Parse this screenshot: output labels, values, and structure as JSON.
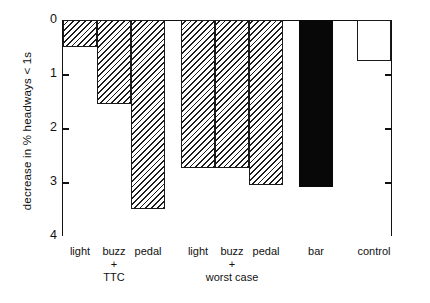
{
  "chart_data": {
    "type": "bar",
    "title": "",
    "xlabel": "",
    "ylabel": "decrease in % headways < 1s",
    "ylim": [
      0,
      4
    ],
    "y_inverted": true,
    "grid": false,
    "legend": null,
    "ytick_labels": [
      "0",
      "1",
      "2",
      "3",
      "4"
    ],
    "ytick_values": [
      0,
      1,
      2,
      3,
      4
    ],
    "categories": [
      "light",
      "buzz",
      "pedal",
      "light",
      "buzz",
      "pedal",
      "bar",
      "control"
    ],
    "values": [
      0.5,
      1.55,
      3.5,
      2.74,
      2.74,
      3.05,
      3.1,
      0.75
    ],
    "bar_styles": [
      "hatched",
      "hatched",
      "hatched",
      "hatched",
      "hatched",
      "hatched",
      "solid",
      "open"
    ],
    "groups": [
      {
        "label_line1": "+",
        "label_line2": "TTC",
        "members": [
          "light",
          "buzz",
          "pedal"
        ]
      },
      {
        "label_line1": "+",
        "label_line2": "worst case",
        "members": [
          "light",
          "buzz",
          "pedal"
        ]
      }
    ],
    "annotations": []
  },
  "axis": {
    "y_title": "decrease in % headways < 1s",
    "ticks": [
      {
        "label": "0",
        "value": 0
      },
      {
        "label": "1",
        "value": 1
      },
      {
        "label": "2",
        "value": 2
      },
      {
        "label": "3",
        "value": 3
      },
      {
        "label": "4",
        "value": 4
      }
    ]
  },
  "xaxis": {
    "labels": [
      {
        "text": "light"
      },
      {
        "text": "buzz"
      },
      {
        "text": "pedal"
      },
      {
        "text": "light"
      },
      {
        "text": "buzz"
      },
      {
        "text": "pedal"
      },
      {
        "text": "bar"
      },
      {
        "text": "control"
      }
    ],
    "group_captions": [
      {
        "plus": "+",
        "name": "TTC"
      },
      {
        "plus": "+",
        "name": "worst case"
      }
    ]
  },
  "colors": {
    "ink": "#111111",
    "hatch": "#1c1c1c",
    "solid_bar": "#080808",
    "background": "#ffffff"
  }
}
